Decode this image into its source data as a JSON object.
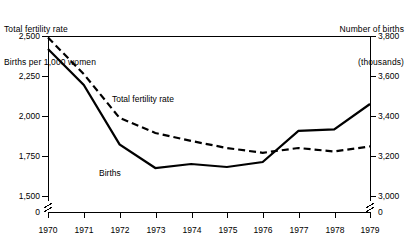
{
  "chart_data": {
    "type": "line",
    "title": "",
    "x": [
      1970,
      1971,
      1972,
      1973,
      1974,
      1975,
      1976,
      1977,
      1978,
      1979
    ],
    "xlabel": "",
    "xtick_labels": [
      "1970",
      "1971",
      "1972",
      "1973",
      "1974",
      "1975",
      "1976",
      "1977",
      "1978",
      "1979"
    ],
    "grid": false,
    "legend": "inline-annotations",
    "axes": [
      {
        "side": "left",
        "label_line1": "Total fertility rate",
        "label_line2": "Births per 1,000 women",
        "ticks": [
          2500,
          2250,
          2000,
          1750,
          1500,
          0
        ],
        "tick_labels": [
          "2,500",
          "2,250",
          "2,000",
          "1,750",
          "1,500",
          "0"
        ],
        "ylim": [
          1500,
          2500
        ],
        "broken_axis": true
      },
      {
        "side": "right",
        "label_line1": "Number of births",
        "label_line2": "(thousands)",
        "ticks": [
          3800,
          3600,
          3400,
          3200,
          3000,
          0
        ],
        "tick_labels": [
          "3,800",
          "3,600",
          "3,400",
          "3,200",
          "3,000",
          "0"
        ],
        "ylim": [
          3000,
          3800
        ],
        "broken_axis": true
      }
    ],
    "series": [
      {
        "name": "Total fertility rate",
        "axis": "left",
        "style": "dashed",
        "color": "#000000",
        "annotation": "Total fertility rate",
        "values": [
          2490,
          2262,
          1988,
          1894,
          1844,
          1800,
          1770,
          1800,
          1778,
          1810
        ]
      },
      {
        "name": "Births",
        "axis": "right",
        "style": "solid",
        "color": "#000000",
        "annotation": "Births",
        "values": [
          3735,
          3555,
          3258,
          3140,
          3160,
          3145,
          3170,
          3326,
          3333,
          3460
        ]
      }
    ]
  },
  "annotations": {
    "total_fertility_rate": "Total fertility rate",
    "births": "Births"
  }
}
